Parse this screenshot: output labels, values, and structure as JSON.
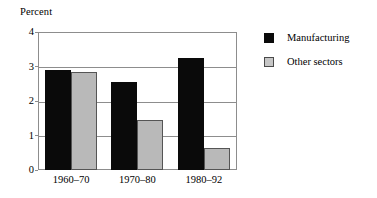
{
  "chart_data": {
    "type": "bar",
    "title": "",
    "xlabel": "",
    "ylabel": "Percent",
    "ylim": [
      0,
      4
    ],
    "yticks": [
      "0",
      "1",
      "2",
      "3",
      "4"
    ],
    "grid": true,
    "legend_position": "right",
    "categories": [
      "1960–70",
      "1970–80",
      "1980–92"
    ],
    "series": [
      {
        "name": "Manufacturing",
        "color": "#0a0a0a",
        "values": [
          2.9,
          2.55,
          3.25
        ]
      },
      {
        "name": "Other sectors",
        "color": "#b9b9b9",
        "values": [
          2.85,
          1.45,
          0.65
        ]
      }
    ]
  },
  "axis": {
    "y_caption": "Percent"
  },
  "legend": {
    "items": [
      {
        "label": "Manufacturing",
        "swatch": "black-square-icon"
      },
      {
        "label": "Other sectors",
        "swatch": "gray-square-icon"
      }
    ]
  }
}
